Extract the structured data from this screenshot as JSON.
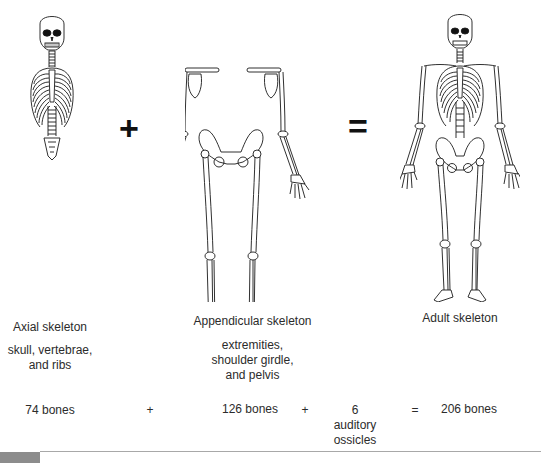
{
  "figure": {
    "panels": [
      {
        "id": "axial",
        "title": "Axial skeleton",
        "description": "skull, vertebrae,\nand ribs",
        "description_lines": [
          "skull, vertebrae,",
          "and ribs"
        ],
        "count": "74 bones"
      },
      {
        "id": "appendicular",
        "title": "Appendicular skeleton",
        "description_lines": [
          "extremities,",
          "shoulder girdle,",
          "and pelvis"
        ],
        "count": "126 bones"
      },
      {
        "id": "adult",
        "title": "Adult skeleton",
        "count": "206 bones"
      }
    ],
    "big_operators": {
      "plus": "+",
      "equals": "="
    },
    "equation": {
      "term1": "74 bones",
      "op1": "+",
      "term2": "126 bones",
      "op2": "+",
      "term3_number": "6",
      "term3_lines": [
        "auditory",
        "ossicles"
      ],
      "op3": "=",
      "result": "206 bones"
    },
    "colors": {
      "line_art": "#1a1a1a",
      "text": "#2b2b2b",
      "divider": "#a8a8a8",
      "figure_tag": "#8c8c8c"
    }
  }
}
